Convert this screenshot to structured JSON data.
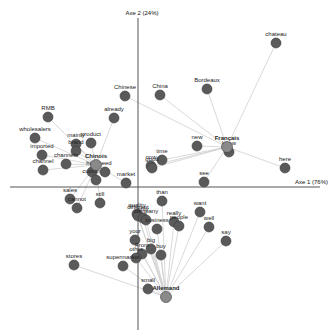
{
  "chart_data": {
    "type": "scatter",
    "title": "",
    "xlabel": "Axe 1 (76%)",
    "ylabel": "Axe 2 (24%)",
    "grid": false,
    "origin_px": {
      "x": 138,
      "y": 187
    },
    "axis_extent_px": {
      "x_min": 10,
      "x_max": 320,
      "y_min": 18,
      "y_max": 330
    },
    "colors": {
      "point": "#5a5a5a",
      "point_stroke": "#3a3a3a",
      "hub_point": "#8a8a8a",
      "link": "#cfcfcf",
      "axis": "#555555"
    },
    "hubs": [
      {
        "label": "Chinois",
        "px": 96,
        "py": 165
      },
      {
        "label": "Français",
        "px": 227,
        "py": 147
      },
      {
        "label": "Allemand",
        "px": 166,
        "py": 297
      }
    ],
    "points": [
      {
        "label": "chateau",
        "px": 276,
        "py": 43,
        "hub": "Français"
      },
      {
        "label": "Bordeaux",
        "px": 207,
        "py": 89,
        "hub": "Français"
      },
      {
        "label": "China",
        "px": 160,
        "py": 95,
        "hub": "Français"
      },
      {
        "label": "Chinese",
        "px": 125,
        "py": 96,
        "hub": "Français"
      },
      {
        "label": "already",
        "px": 114,
        "py": 118,
        "hub": "Chinois"
      },
      {
        "label": "RMB",
        "px": 48,
        "py": 117,
        "hub": "Chinois"
      },
      {
        "label": "wholesalers",
        "px": 35,
        "py": 138,
        "hub": "Chinois"
      },
      {
        "label": "mainly",
        "px": 76,
        "py": 144,
        "hub": "Chinois"
      },
      {
        "label": "product",
        "px": 91,
        "py": 143,
        "hub": "Chinois"
      },
      {
        "label": "brand",
        "px": 76,
        "py": 151,
        "hub": "Chinois"
      },
      {
        "label": "imported",
        "px": 42,
        "py": 155,
        "hub": "Chinois"
      },
      {
        "label": "channels",
        "px": 66,
        "py": 164,
        "hub": "Chinois"
      },
      {
        "label": "channel",
        "px": 43,
        "py": 170,
        "hub": "Chinois"
      },
      {
        "label": "high",
        "px": 92,
        "py": 172,
        "hub": "Chinois"
      },
      {
        "label": "customers",
        "px": 96,
        "py": 180,
        "hub": "Chinois"
      },
      {
        "label": "need",
        "px": 105,
        "py": 172,
        "hub": "Chinois"
      },
      {
        "label": "market",
        "px": 126,
        "py": 183,
        "hub": "Chinois"
      },
      {
        "label": "new",
        "px": 197,
        "py": 146,
        "hub": "Français"
      },
      {
        "label": "know",
        "px": 229,
        "py": 152,
        "hub": "Français"
      },
      {
        "label": "here",
        "px": 285,
        "py": 168,
        "hub": "Français"
      },
      {
        "label": "time",
        "px": 162,
        "py": 160,
        "hub": "Français"
      },
      {
        "label": "now",
        "px": 151,
        "py": 166,
        "hub": "Français"
      },
      {
        "label": "good",
        "px": 152,
        "py": 168,
        "hub": "Français"
      },
      {
        "label": "see",
        "px": 204,
        "py": 182,
        "hub": "Français"
      },
      {
        "label": "than",
        "px": 162,
        "py": 201,
        "hub": "Allemand"
      },
      {
        "label": "sales",
        "px": 70,
        "py": 199,
        "hub": "Chinois"
      },
      {
        "label": "cannot",
        "px": 77,
        "py": 208,
        "hub": "Chinois"
      },
      {
        "label": "still",
        "px": 100,
        "py": 203,
        "hub": "Chinois"
      },
      {
        "label": "quality",
        "px": 137,
        "py": 214,
        "hub": "Allemand"
      },
      {
        "label": "different",
        "px": 138,
        "py": 216,
        "hub": "Allemand"
      },
      {
        "label": "only",
        "px": 143,
        "py": 218,
        "hub": "Allemand"
      },
      {
        "label": "company",
        "px": 146,
        "py": 220,
        "hub": "Allemand"
      },
      {
        "label": "really",
        "px": 174,
        "py": 222,
        "hub": "Allemand"
      },
      {
        "label": "people",
        "px": 179,
        "py": 226,
        "hub": "Allemand"
      },
      {
        "label": "want",
        "px": 200,
        "py": 212,
        "hub": "Allemand"
      },
      {
        "label": "well",
        "px": 209,
        "py": 227,
        "hub": "Allemand"
      },
      {
        "label": "say",
        "px": 226,
        "py": 241,
        "hub": "Allemand"
      },
      {
        "label": "business",
        "px": 157,
        "py": 229,
        "hub": "Allemand"
      },
      {
        "label": "your",
        "px": 135,
        "py": 240,
        "hub": "Allemand"
      },
      {
        "label": "big",
        "px": 151,
        "py": 249,
        "hub": "Allemand"
      },
      {
        "label": "From",
        "px": 142,
        "py": 254,
        "hub": "Allemand"
      },
      {
        "label": "buy",
        "px": 161,
        "py": 255,
        "hub": "Allemand"
      },
      {
        "label": "other",
        "px": 136,
        "py": 258,
        "hub": "Allemand"
      },
      {
        "label": "supermarket",
        "px": 123,
        "py": 266,
        "hub": "Allemand"
      },
      {
        "label": "stores",
        "px": 74,
        "py": 265,
        "hub": "Allemand"
      },
      {
        "label": "small",
        "px": 148,
        "py": 289,
        "hub": "Allemand"
      }
    ]
  }
}
